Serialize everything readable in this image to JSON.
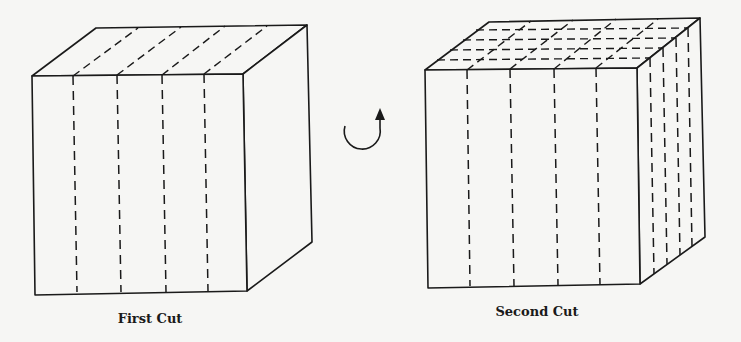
{
  "figure": {
    "panels": [
      {
        "caption": "First Cut",
        "description": "Cube with four parallel vertical cuts on the front face, continuing as dashed lines across the top face"
      },
      {
        "caption": "Second Cut",
        "description": "Cube rotated, cut four times along the front face and four times along the side face, forming a grid of dashed lines on the top"
      }
    ],
    "rotation_arrow": "clockwise-rotation"
  },
  "colors": {
    "ink": "#1a1a1a",
    "background": "#f6f6f4"
  }
}
